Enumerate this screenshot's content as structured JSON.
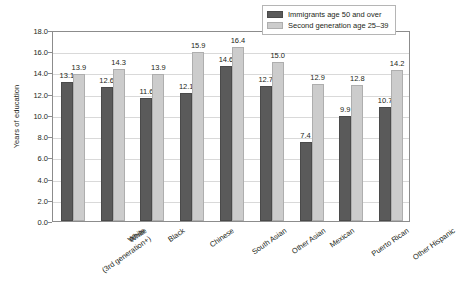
{
  "chart_data": {
    "type": "bar",
    "title": "",
    "xlabel": "",
    "ylabel": "Years of education",
    "ylim": [
      0,
      18
    ],
    "ytick_step": 2,
    "ytick_labels": [
      "0.0",
      "2.0",
      "4.0",
      "6.0",
      "8.0",
      "10.0",
      "12.0",
      "14.0",
      "16.0",
      "18.0"
    ],
    "grid": true,
    "legend_position": "top-right",
    "categories": [
      "White\n(3rd generation+)",
      "White",
      "Black",
      "Chinese",
      "South Asian",
      "Other Asian",
      "Mexican",
      "Puerto Rican",
      "Other Hispanic"
    ],
    "category_lines": [
      [
        "White",
        "(3rd generation+)"
      ],
      [
        "White"
      ],
      [
        "Black"
      ],
      [
        "Chinese"
      ],
      [
        "South Asian"
      ],
      [
        "Other Asian"
      ],
      [
        "Mexican"
      ],
      [
        "Puerto Rican"
      ],
      [
        "Other Hispanic"
      ]
    ],
    "series": [
      {
        "name": "Immigrants age 50 and over",
        "color": "#5a5a5a",
        "values": [
          13.1,
          12.6,
          11.6,
          12.1,
          14.6,
          12.7,
          7.4,
          9.9,
          10.7
        ],
        "labels": [
          "13.1",
          "12.6",
          "11.6",
          "12.1",
          "14.6",
          "12.7",
          "7.4",
          "9.9",
          "10.7"
        ]
      },
      {
        "name": "Second generation age 25–39",
        "color": "#cccccc",
        "values": [
          13.9,
          14.3,
          13.9,
          15.9,
          16.4,
          15.0,
          12.9,
          12.8,
          14.2
        ],
        "labels": [
          "13.9",
          "14.3",
          "13.9",
          "15.9",
          "16.4",
          "15.0",
          "12.9",
          "12.8",
          "14.2"
        ]
      }
    ]
  }
}
